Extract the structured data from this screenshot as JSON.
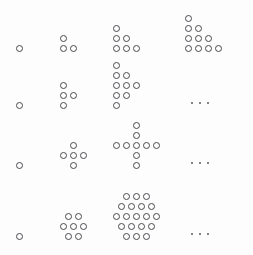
{
  "figure": {
    "background_color": "#fdfdfd",
    "dot_color": "#4a4a4f",
    "dot_diameter_px": 7,
    "dot_pitch_px": 10,
    "width_px": 253,
    "height_px": 255,
    "ellipsis_label": "..."
  },
  "chart_data": {
    "type": "scatter",
    "xlabel": "",
    "ylabel": "",
    "grid": false,
    "legend": "none",
    "sequences": [
      {
        "name": "triangular-numbers",
        "row_index": 0,
        "terms": [
          {
            "count": 1,
            "rows": [
              1
            ],
            "alignment": "left"
          },
          {
            "count": 3,
            "rows": [
              1,
              2
            ],
            "alignment": "left"
          },
          {
            "count": 6,
            "rows": [
              1,
              2,
              3
            ],
            "alignment": "left"
          },
          {
            "count": 10,
            "rows": [
              1,
              2,
              3,
              4
            ],
            "alignment": "left"
          }
        ],
        "values": [
          1,
          3,
          6,
          10
        ],
        "has_ellipsis": false
      },
      {
        "name": "square-numbers-diagonal",
        "row_index": 1,
        "terms": [
          {
            "count": 1,
            "rows": [
              1
            ],
            "alignment": "left"
          },
          {
            "count": 4,
            "rows": [
              1,
              2,
              1
            ],
            "alignment": "left"
          },
          {
            "count": 9,
            "rows": [
              1,
              2,
              3,
              2,
              1
            ],
            "alignment": "left"
          }
        ],
        "values": [
          1,
          4,
          9
        ],
        "has_ellipsis": true
      },
      {
        "name": "cross-numbers",
        "row_index": 2,
        "terms": [
          {
            "count": 1,
            "rows": [
              1
            ],
            "alignment": "center"
          },
          {
            "count": 5,
            "rows": [
              1,
              3,
              1
            ],
            "alignment": "center"
          },
          {
            "count": 9,
            "rows": [
              1,
              1,
              5,
              1,
              1
            ],
            "alignment": "center"
          }
        ],
        "values": [
          1,
          5,
          9
        ],
        "has_ellipsis": true
      },
      {
        "name": "centered-hexagonal-numbers",
        "row_index": 3,
        "terms": [
          {
            "count": 1,
            "rows": [
              1
            ],
            "alignment": "center"
          },
          {
            "count": 7,
            "rows": [
              2,
              3,
              2
            ],
            "alignment": "center"
          },
          {
            "count": 19,
            "rows": [
              3,
              4,
              5,
              4,
              3
            ],
            "alignment": "center"
          }
        ],
        "values": [
          1,
          7,
          19
        ],
        "has_ellipsis": true
      }
    ]
  },
  "layout": {
    "row_baselines": [
      55,
      112,
      172,
      243
    ],
    "column_origins": [
      16,
      60,
      113,
      185
    ]
  }
}
